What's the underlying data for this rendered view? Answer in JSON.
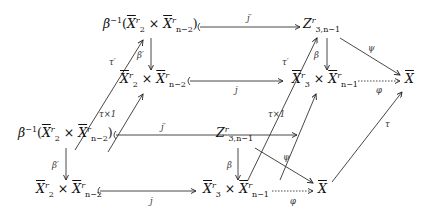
{
  "diagram": {
    "type": "commutative-diagram",
    "nodes": {
      "back_top_left": "β⁻¹(X̄₂ʳ × X̄ʳₙ₋₂)",
      "back_top_mid": "Z³,ₙ₋₁ʳ",
      "back_mid_left": "X̄₂ʳ × X̄ʳₙ₋₂",
      "back_mid_mid": "X̄₃ʳ × X̄ʳₙ₋₁",
      "back_right": "X̄",
      "front_top_left": "β⁻¹(X̄₂ʳ × X̄ʳₙ₋₂)",
      "front_top_mid": "Z³,ₙ₋₁ʳ",
      "front_bot_left": "X̄₂ʳ × X̄ʳₙ₋₂",
      "front_bot_mid": "X̄₃ʳ × X̄ʳₙ₋₁",
      "front_right": "X̄"
    },
    "arrow_labels": {
      "j_prime_top": "j′",
      "beta_prime_top": "β′",
      "beta_top": "β",
      "psi_top": "ψ",
      "j_top": "j",
      "phi_top": "φ",
      "tau_prime_left": "τ′",
      "tau_times_1_left": "τ×1",
      "tau_prime_right": "τ′",
      "tau_times_1_right": "τ×1",
      "j_prime_bottom": "j′",
      "beta_prime_bottom": "β′",
      "beta_bottom": "β",
      "psi_bottom": "ψ",
      "j_bottom": "j",
      "phi_bottom": "φ",
      "tau_right": "τ"
    },
    "parts": {
      "beta_inv": "β",
      "inv_sup": "−1",
      "X": "X",
      "Z": "Z",
      "r": "r",
      "two": "2",
      "three": "3",
      "n2": "n−2",
      "n1": "n−1",
      "three_n1": "3,n−1",
      "times": " × ",
      "lparen": "(",
      "rparen": ")"
    }
  }
}
